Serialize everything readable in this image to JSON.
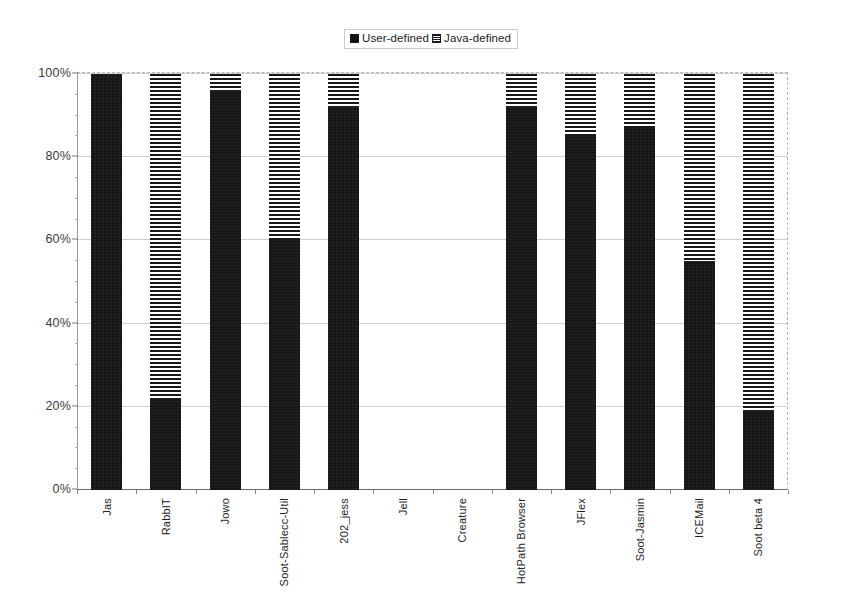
{
  "chart_data": {
    "type": "bar",
    "subtype": "stacked-100-percent",
    "title": "",
    "xlabel": "",
    "ylabel": "",
    "ylim": [
      0,
      100
    ],
    "ytick_labels": [
      "0%",
      "20%",
      "40%",
      "60%",
      "80%",
      "100%"
    ],
    "ytick_values": [
      0,
      20,
      40,
      60,
      80,
      100
    ],
    "grid": true,
    "legend_position": "top-center",
    "categories": [
      "Jas",
      "RabbIT",
      "Jowo",
      "Soot-Sablecc-Util",
      "202_jess",
      "Jell",
      "Creature",
      "HotPath Browser",
      "JFlex",
      "Soot-Jasmin",
      "ICEMail",
      "Soot beta 4"
    ],
    "series": [
      {
        "name": "User-defined",
        "fill": "solid-black",
        "color": "#151515",
        "values": [
          100,
          22,
          96,
          60,
          92,
          0,
          0,
          92,
          85,
          87,
          55,
          19
        ]
      },
      {
        "name": "Java-defined",
        "fill": "horizontal-stripes",
        "color": "#191919",
        "values": [
          0,
          78,
          4,
          40,
          8,
          0,
          0,
          8,
          15,
          13,
          45,
          81
        ]
      }
    ]
  },
  "legend": {
    "entries": [
      {
        "label": "User-defined",
        "swatch": "solid"
      },
      {
        "label": "Java-defined",
        "swatch": "striped"
      }
    ]
  },
  "colors": {
    "user_defined": "#151515",
    "java_defined": "#191919",
    "gridline": "#cfcfcf",
    "axis": "#6a6a6a",
    "background": "#ffffff"
  }
}
